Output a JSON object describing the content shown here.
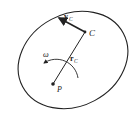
{
  "diagram": {
    "type": "rigid-body-kinematics",
    "points": {
      "C": {
        "label": "C",
        "x": 85,
        "y": 32
      },
      "P": {
        "label": "P",
        "x": 53,
        "y": 84
      }
    },
    "vectors": {
      "v": {
        "symbol": "v",
        "subscript": "C"
      },
      "r": {
        "symbol": "r",
        "subscript": "C"
      }
    },
    "angular_velocity": {
      "symbol": "ω"
    },
    "colors": {
      "stroke": "#222222",
      "background": "#ffffff"
    }
  }
}
